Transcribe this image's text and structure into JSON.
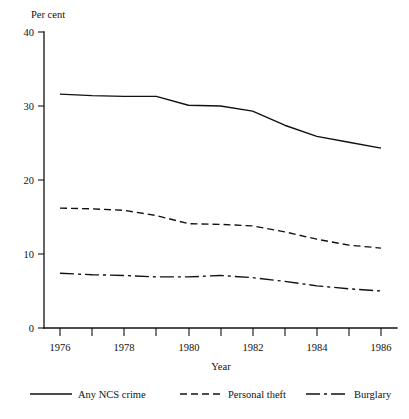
{
  "chart_data": {
    "type": "line",
    "title": "",
    "xlabel": "Year",
    "ylabel": "Per cent",
    "x": [
      1976,
      1977,
      1978,
      1979,
      1980,
      1981,
      1982,
      1983,
      1984,
      1985,
      1986
    ],
    "xlim": [
      1976,
      1986
    ],
    "ylim": [
      0,
      40
    ],
    "x_tick_values": [
      1976,
      1977,
      1978,
      1979,
      1980,
      1981,
      1982,
      1983,
      1984,
      1985,
      1986
    ],
    "x_tick_labels": [
      "1976",
      "",
      "1978",
      "",
      "1980",
      "",
      "1982",
      "",
      "1984",
      "",
      "1986"
    ],
    "y_tick_values": [
      0,
      10,
      20,
      30,
      40
    ],
    "y_tick_labels": [
      "0",
      "10",
      "20",
      "30",
      "40"
    ],
    "grid": false,
    "legend_position": "bottom",
    "series": [
      {
        "name": "Any NCS crime",
        "style": "solid",
        "values": [
          31.6,
          31.4,
          31.3,
          31.3,
          30.1,
          30.0,
          29.3,
          27.4,
          25.9,
          25.1,
          24.3
        ]
      },
      {
        "name": "Personal theft",
        "style": "dashed",
        "values": [
          16.2,
          16.1,
          15.9,
          15.2,
          14.1,
          14.0,
          13.8,
          13.0,
          12.0,
          11.2,
          10.8
        ]
      },
      {
        "name": "Burglary",
        "style": "dash-dot",
        "values": [
          7.4,
          7.2,
          7.1,
          6.9,
          6.9,
          7.1,
          6.8,
          6.3,
          5.7,
          5.3,
          5.0
        ]
      }
    ]
  },
  "axes": {
    "y_axis_title": "Per cent",
    "x_axis_title": "Year",
    "y_ticks": [
      "40",
      "30",
      "20",
      "10",
      "0"
    ],
    "x_ticks": [
      "1976",
      "1978",
      "1980",
      "1982",
      "1984",
      "1986"
    ]
  },
  "legend": {
    "entries": [
      {
        "label": "Any NCS crime",
        "style": "solid"
      },
      {
        "label": "Personal theft",
        "style": "dashed"
      },
      {
        "label": "Burglary",
        "style": "dash-dot"
      }
    ]
  },
  "colors": {
    "ink": "#111111",
    "background": "#ffffff"
  }
}
